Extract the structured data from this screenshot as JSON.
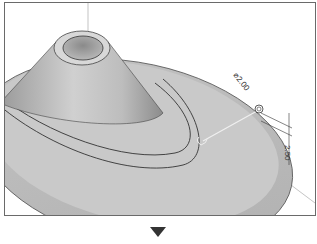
{
  "figure": {
    "dimensions": [
      {
        "id": "diameter",
        "label": "⌀2.00"
      },
      {
        "id": "depth",
        "label": "2.50"
      }
    ],
    "colors": {
      "frame": "#6a6a6a",
      "surface_light": "#d4d4d4",
      "surface_dark": "#8a8a8a",
      "edge": "#333333",
      "arrow": "#333333"
    }
  },
  "navigation": {
    "next_step_icon": "down-triangle-icon"
  }
}
